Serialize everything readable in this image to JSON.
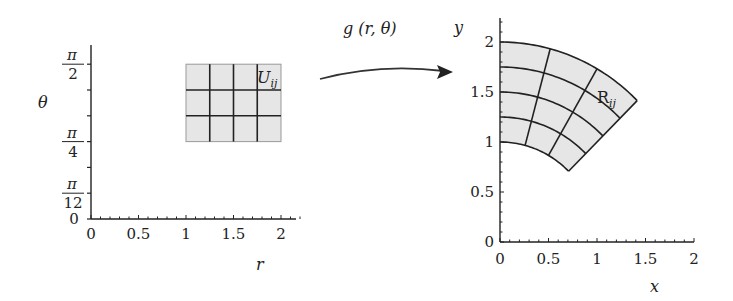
{
  "colors": {
    "ink": "#222222",
    "fill": "#e6e6e6",
    "background": "#ffffff"
  },
  "mapping": {
    "label": "g (r, θ)"
  },
  "left_plot": {
    "xlabel": "r",
    "ylabel": "θ",
    "x_ticks": [
      {
        "value": 0,
        "label": "0"
      },
      {
        "value": 0.5,
        "label": "0.5"
      },
      {
        "value": 1,
        "label": "1"
      },
      {
        "value": 1.5,
        "label": "1.5"
      },
      {
        "value": 2,
        "label": "2"
      }
    ],
    "y_ticks": [
      {
        "value_pi_over_12": 0,
        "label": "0"
      },
      {
        "value_pi_over_12": 1,
        "num": "π",
        "den": "12"
      },
      {
        "value_pi_over_12": 3,
        "num": "π",
        "den": "4"
      },
      {
        "value_pi_over_12": 6,
        "num": "π",
        "den": "2"
      }
    ],
    "region": {
      "label": "U",
      "subscript": "ij",
      "r_range": [
        1,
        2
      ],
      "theta_range": [
        "π/4",
        "π/2"
      ],
      "r_divisions": 4,
      "theta_divisions": 3
    }
  },
  "right_plot": {
    "xlabel": "x",
    "ylabel": "y",
    "x_ticks": [
      {
        "value": 0,
        "label": "0"
      },
      {
        "value": 0.5,
        "label": "0.5"
      },
      {
        "value": 1,
        "label": "1"
      },
      {
        "value": 1.5,
        "label": "1.5"
      },
      {
        "value": 2,
        "label": "2"
      }
    ],
    "y_ticks": [
      {
        "value": 0,
        "label": "0"
      },
      {
        "value": 0.5,
        "label": "0.5"
      },
      {
        "value": 1,
        "label": "1"
      },
      {
        "value": 1.5,
        "label": "1.5"
      },
      {
        "value": 2,
        "label": "2"
      }
    ],
    "region": {
      "label": "R",
      "subscript": "ij",
      "radii": [
        1,
        1.25,
        1.5,
        1.75,
        2
      ],
      "angles_deg": [
        45,
        60,
        75,
        90
      ]
    }
  }
}
